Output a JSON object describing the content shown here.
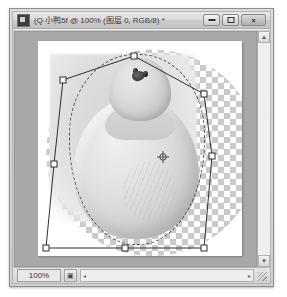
{
  "window": {
    "title": "(Q 小鸭5f @ 100% (图层 0, RGB/8) *",
    "app_icon": "photoshop-icon",
    "controls": {
      "minimize": "minimize-icon",
      "maximize": "maximize-icon",
      "close": "×"
    }
  },
  "canvas": {
    "zoom_display": "100%",
    "document_state": "free-transform-active",
    "selection": "elliptical-marching-ants",
    "transparency": "checkerboard",
    "artwork": "duck-photo-grayscale"
  },
  "transform": {
    "handles": [
      {
        "name": "handle-top-left",
        "x": 48,
        "y": 48
      },
      {
        "name": "handle-top-center",
        "x": 119,
        "y": 24
      },
      {
        "name": "handle-top-right",
        "x": 189,
        "y": 62
      },
      {
        "name": "handle-middle-right",
        "x": 197,
        "y": 124
      },
      {
        "name": "handle-bottom-right",
        "x": 189,
        "y": 216
      },
      {
        "name": "handle-bottom-center",
        "x": 110,
        "y": 216
      },
      {
        "name": "handle-bottom-left",
        "x": 31,
        "y": 216
      },
      {
        "name": "handle-middle-left",
        "x": 39,
        "y": 132
      }
    ],
    "reference_point": {
      "name": "transform-reference-point",
      "x": 148,
      "y": 125
    }
  },
  "statusbar": {
    "zoom_value": "100%",
    "doc_icon": "document-thumb-icon",
    "scroll_left_arrow": "◂",
    "scroll_right_arrow": "▸",
    "resize_grip": "resize-grip-icon"
  },
  "scrollbar": {
    "up_arrow": "▲",
    "down_arrow": "▼"
  },
  "colors": {
    "titlebar": "#dadada",
    "pasteboard": "#a8a8a8",
    "page": "#ffffff",
    "checker": "#c8c8c8",
    "transform_line": "#2f2f2f",
    "handle_fill": "#ffffff"
  }
}
